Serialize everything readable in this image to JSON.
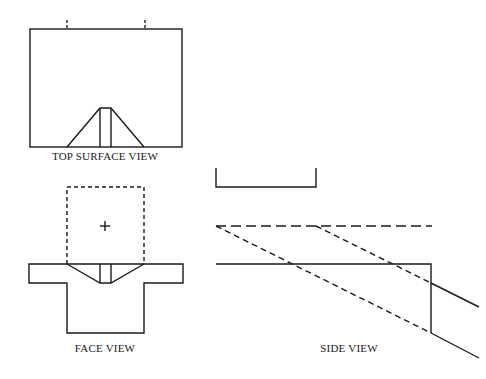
{
  "labels": {
    "top_surface_view": "TOP SURFACE VIEW",
    "face_view": "FACE VIEW",
    "side_view": "SIDE VIEW"
  },
  "colors": {
    "line": "#1a1a1a",
    "background": "#ffffff"
  }
}
